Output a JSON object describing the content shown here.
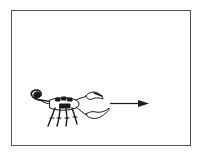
{
  "figure": {
    "direction": "right",
    "colors": {
      "border": "#555555",
      "ink": "#1a1a1a",
      "background": "#ffffff"
    }
  }
}
